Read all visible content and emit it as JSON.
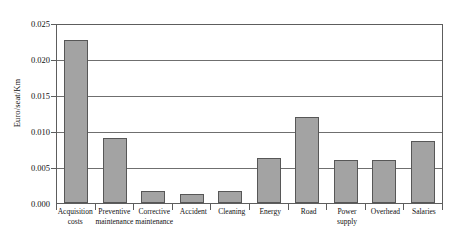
{
  "chart_data": {
    "type": "bar",
    "title": "",
    "xlabel": "",
    "ylabel": "Euro/seat/Km",
    "ylim": [
      0,
      0.025
    ],
    "yticks": [
      "0.000",
      "0.005",
      "0.010",
      "0.015",
      "0.020",
      "0.025"
    ],
    "ytick_values": [
      0,
      0.005,
      0.01,
      0.015,
      0.02,
      0.025
    ],
    "grid": true,
    "legend": "none",
    "bar_color": "#a3a3a3",
    "bar_edge_color": "#575757",
    "axis_color": "#5d5d5d",
    "categories": [
      "Acquisition costs",
      "Preventive maintenance",
      "Corrective maintenance",
      "Accident",
      "Cleaning",
      "Energy",
      "Road",
      "Power supply",
      "Overhead",
      "Salaries"
    ],
    "values": [
      0.0226,
      0.009,
      0.0017,
      0.0013,
      0.0017,
      0.0063,
      0.012,
      0.006,
      0.006,
      0.0086
    ]
  }
}
